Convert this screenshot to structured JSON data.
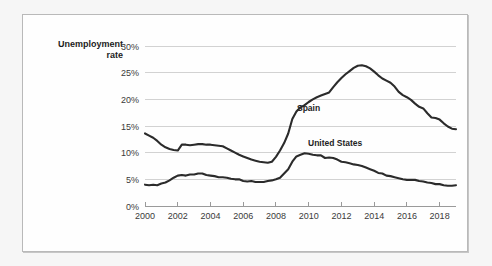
{
  "figure": {
    "axis_title_line1": "Unemployment",
    "axis_title_line2": "rate",
    "background_color": "#fefefe",
    "page_background_color": "#f6f6f6",
    "border_color": "#b9b9b9"
  },
  "chart_data": {
    "type": "line",
    "title": "",
    "subtitle": "",
    "xlabel": "",
    "ylabel": "Unemployment rate",
    "xlim": [
      2000,
      2019
    ],
    "ylim": [
      0,
      30
    ],
    "grid": true,
    "grid_axis": "y",
    "legend_position": "inline-annotations",
    "y_tick_labels": [
      "0%",
      "5%",
      "10%",
      "15%",
      "20%",
      "25%",
      "30%"
    ],
    "y_tick_values": [
      0,
      5,
      10,
      15,
      20,
      25,
      30
    ],
    "x_tick_labels": [
      "2000",
      "2002",
      "2004",
      "2006",
      "2008",
      "2010",
      "2012",
      "2014",
      "2016",
      "2018"
    ],
    "x_tick_values": [
      2000,
      2002,
      2004,
      2006,
      2008,
      2010,
      2012,
      2014,
      2016,
      2018
    ],
    "line_color": "#2b2b2b",
    "annotations": [
      {
        "text": "Spain",
        "x": 2011.4,
        "y": 17.5
      },
      {
        "text": "United States",
        "x": 2012.1,
        "y": 11.0
      }
    ],
    "series": [
      {
        "name": "Spain",
        "color": "#2b2b2b",
        "x": [
          2000.0,
          2000.25,
          2000.5,
          2000.75,
          2001.0,
          2001.25,
          2001.5,
          2001.75,
          2002.0,
          2002.25,
          2002.5,
          2002.75,
          2003.0,
          2003.25,
          2003.5,
          2003.75,
          2004.0,
          2004.25,
          2004.5,
          2004.75,
          2005.0,
          2005.25,
          2005.5,
          2005.75,
          2006.0,
          2006.25,
          2006.5,
          2006.75,
          2007.0,
          2007.25,
          2007.5,
          2007.75,
          2008.0,
          2008.25,
          2008.5,
          2008.75,
          2009.0,
          2009.25,
          2009.5,
          2009.75,
          2010.0,
          2010.25,
          2010.5,
          2010.75,
          2011.0,
          2011.25,
          2011.5,
          2011.75,
          2012.0,
          2012.25,
          2012.5,
          2012.75,
          2013.0,
          2013.25,
          2013.5,
          2013.75,
          2014.0,
          2014.25,
          2014.5,
          2014.75,
          2015.0,
          2015.25,
          2015.5,
          2015.75,
          2016.0,
          2016.25,
          2016.5,
          2016.75,
          2017.0,
          2017.25,
          2017.5,
          2017.75,
          2018.0,
          2018.25,
          2018.5,
          2018.75,
          2019.0
        ],
        "values": [
          13.6,
          13.2,
          12.8,
          12.2,
          11.5,
          11.0,
          10.7,
          10.5,
          10.4,
          11.5,
          11.5,
          11.4,
          11.5,
          11.6,
          11.6,
          11.5,
          11.5,
          11.4,
          11.3,
          11.2,
          10.8,
          10.4,
          10.0,
          9.6,
          9.3,
          9.0,
          8.7,
          8.5,
          8.3,
          8.2,
          8.1,
          8.3,
          9.2,
          10.4,
          11.8,
          13.6,
          16.3,
          17.7,
          18.5,
          18.9,
          19.5,
          20.0,
          20.4,
          20.7,
          21.0,
          21.3,
          22.3,
          23.2,
          24.0,
          24.7,
          25.3,
          25.9,
          26.3,
          26.4,
          26.2,
          25.8,
          25.2,
          24.5,
          23.9,
          23.5,
          23.1,
          22.4,
          21.4,
          20.8,
          20.4,
          19.9,
          19.2,
          18.6,
          18.3,
          17.4,
          16.6,
          16.5,
          16.2,
          15.5,
          14.9,
          14.5,
          14.4
        ]
      },
      {
        "name": "United States",
        "color": "#2b2b2b",
        "x": [
          2000.0,
          2000.25,
          2000.5,
          2000.75,
          2001.0,
          2001.25,
          2001.5,
          2001.75,
          2002.0,
          2002.25,
          2002.5,
          2002.75,
          2003.0,
          2003.25,
          2003.5,
          2003.75,
          2004.0,
          2004.25,
          2004.5,
          2004.75,
          2005.0,
          2005.25,
          2005.5,
          2005.75,
          2006.0,
          2006.25,
          2006.5,
          2006.75,
          2007.0,
          2007.25,
          2007.5,
          2007.75,
          2008.0,
          2008.25,
          2008.5,
          2008.75,
          2009.0,
          2009.25,
          2009.5,
          2009.75,
          2010.0,
          2010.25,
          2010.5,
          2010.75,
          2011.0,
          2011.25,
          2011.5,
          2011.75,
          2012.0,
          2012.25,
          2012.5,
          2012.75,
          2013.0,
          2013.25,
          2013.5,
          2013.75,
          2014.0,
          2014.25,
          2014.5,
          2014.75,
          2015.0,
          2015.25,
          2015.5,
          2015.75,
          2016.0,
          2016.25,
          2016.5,
          2016.75,
          2017.0,
          2017.25,
          2017.5,
          2017.75,
          2018.0,
          2018.25,
          2018.5,
          2018.75,
          2019.0
        ],
        "values": [
          4.0,
          3.9,
          4.0,
          3.9,
          4.2,
          4.4,
          4.8,
          5.3,
          5.7,
          5.8,
          5.7,
          5.9,
          5.9,
          6.1,
          6.1,
          5.8,
          5.7,
          5.6,
          5.4,
          5.4,
          5.3,
          5.1,
          5.0,
          5.0,
          4.7,
          4.6,
          4.7,
          4.5,
          4.5,
          4.5,
          4.7,
          4.8,
          5.0,
          5.3,
          6.1,
          6.9,
          8.3,
          9.3,
          9.6,
          9.9,
          9.8,
          9.6,
          9.5,
          9.5,
          9.0,
          9.1,
          9.0,
          8.7,
          8.3,
          8.2,
          8.0,
          7.8,
          7.7,
          7.5,
          7.2,
          6.9,
          6.6,
          6.2,
          6.1,
          5.7,
          5.6,
          5.4,
          5.2,
          5.0,
          4.9,
          4.9,
          4.9,
          4.7,
          4.6,
          4.4,
          4.3,
          4.1,
          4.1,
          3.9,
          3.8,
          3.8,
          3.9
        ]
      }
    ]
  }
}
